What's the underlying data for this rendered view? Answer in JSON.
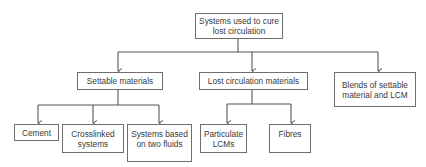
{
  "diagram": {
    "type": "hierarchy",
    "root": {
      "label": "Systems used to cure lost circulation"
    },
    "level1": [
      {
        "label": "Settable materials"
      },
      {
        "label": "Lost circulation materials"
      },
      {
        "label": "Blends of settable material and LCM"
      }
    ],
    "settable_children": [
      {
        "label": "Cement"
      },
      {
        "label": "Crosslinked systems"
      },
      {
        "label": "Systems based on two fluids"
      }
    ],
    "lcm_children": [
      {
        "label": "Particulate LCMs"
      },
      {
        "label": "Fibres"
      }
    ],
    "colors": {
      "line": "#555555",
      "border": "#6e6e6e",
      "text": "#3a3a3a",
      "background": "#ffffff"
    }
  }
}
